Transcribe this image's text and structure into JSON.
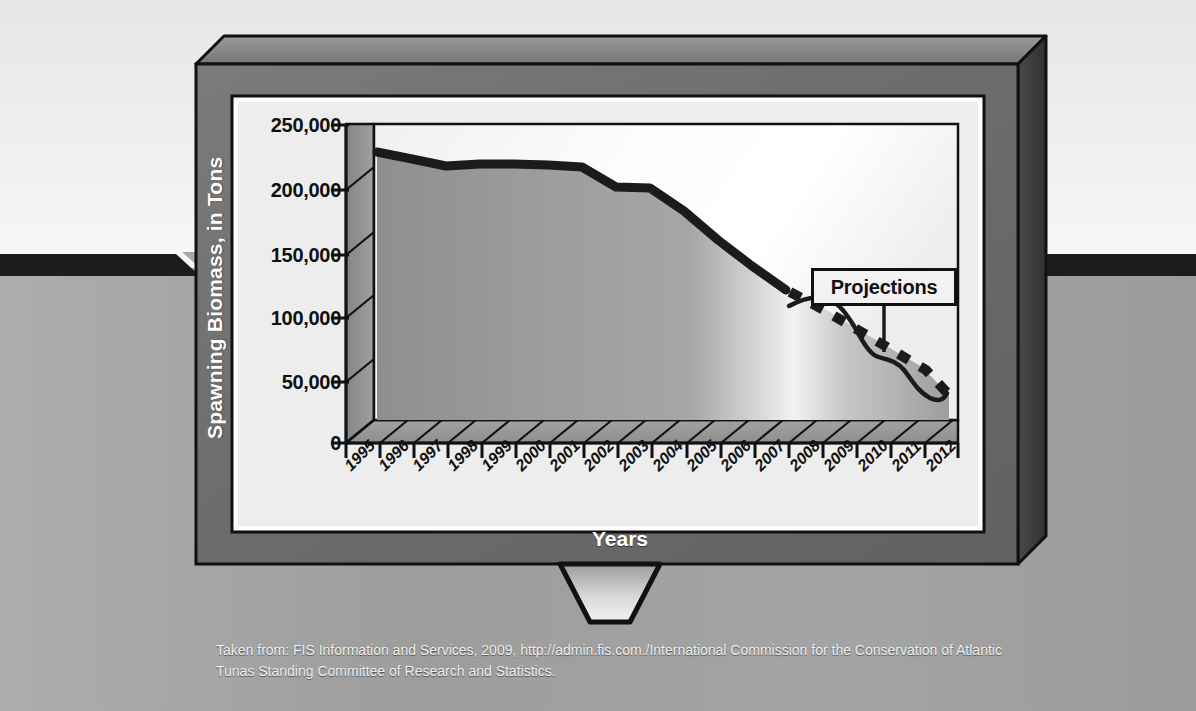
{
  "figure": {
    "device": "television-monitor",
    "caption": "Taken from: FIS Information and Services, 2009, http://admin.fis.com./International Commission for the Conservation of Atlantic Tunas Standing Committee of Research and Statistics."
  },
  "callout": {
    "label": "Projections"
  },
  "colors": {
    "frame": "#6d6d6d",
    "frame_top_bevel": "#8a8a8a",
    "frame_side_bevel": "#3e3e3e",
    "screen": "#ececec",
    "plot_bg_light": "#fbfbfb",
    "line": "#1b1b1b",
    "area_fill": "#9a9a9a",
    "text_light": "#ffffff",
    "text_dark": "#111111",
    "background": "#a8a8a8"
  },
  "chart_data": {
    "type": "area",
    "title": "",
    "xlabel": "Years",
    "ylabel": "Spawning Biomass, in Tons",
    "xlim": [
      1995,
      2012
    ],
    "ylim": [
      0,
      250000
    ],
    "ytick_labels": [
      "250,000",
      "200,000",
      "150,000",
      "100,000",
      "50,000",
      "0"
    ],
    "ytick_values": [
      250000,
      200000,
      150000,
      100000,
      50000,
      0
    ],
    "categories": [
      "1995",
      "1996",
      "1997",
      "1998",
      "1999",
      "2000",
      "2001",
      "2002",
      "2003",
      "2004",
      "2005",
      "2006",
      "2007",
      "2008",
      "2009",
      "2010",
      "2011",
      "2012"
    ],
    "grid": false,
    "legend": null,
    "annotations": [
      {
        "text": "Projections",
        "points_to": "projection-curves",
        "start_year": 2008
      }
    ],
    "series": [
      {
        "name": "Spawning biomass (observed)",
        "style": "solid-thick",
        "x": [
          1995,
          1996,
          1997,
          1998,
          1999,
          2000,
          2001,
          2002,
          2003,
          2004,
          2005,
          2006,
          2007,
          2008
        ],
        "values": [
          226000,
          220000,
          214000,
          216000,
          216000,
          215000,
          213000,
          197000,
          196000,
          176000,
          152000,
          130000,
          110000,
          93000
        ]
      },
      {
        "name": "Projection (lower, dashed)",
        "style": "dashed-thick",
        "x": [
          2008,
          2009,
          2010,
          2011,
          2012
        ],
        "values": [
          93000,
          76000,
          60000,
          43000,
          24000
        ]
      },
      {
        "name": "Projection (upper, thin curve)",
        "style": "solid-thin",
        "x": [
          2008,
          2009,
          2010,
          2011,
          2012
        ],
        "values": [
          98000,
          99000,
          81000,
          73000,
          40000
        ]
      }
    ]
  }
}
